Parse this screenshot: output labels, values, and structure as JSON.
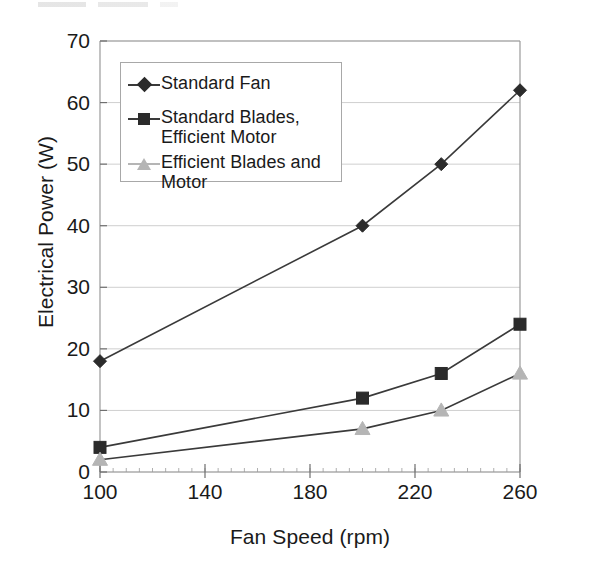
{
  "chart_data": {
    "type": "line",
    "title": "",
    "subtitle": "",
    "xlabel": "Fan Speed (rpm)",
    "ylabel": "Electrical Power (W)",
    "xlim": [
      100,
      260
    ],
    "ylim": [
      0,
      70
    ],
    "xticks": [
      100,
      140,
      180,
      220,
      260
    ],
    "yticks": [
      0,
      10,
      20,
      30,
      40,
      50,
      60,
      70
    ],
    "xtick_labels": [
      "100",
      "140",
      "180",
      "220",
      "260"
    ],
    "ytick_labels": [
      "0",
      "10",
      "20",
      "30",
      "40",
      "50",
      "60",
      "70"
    ],
    "grid": "horizontal",
    "legend_position": "upper-left-inside",
    "x": [
      100,
      200,
      230,
      260
    ],
    "series": [
      {
        "name": "Standard Fan",
        "marker": "diamond",
        "color": "#2b2b2b",
        "line_color": "#3a3a3a",
        "values": [
          18,
          40,
          50,
          62
        ]
      },
      {
        "name": "Standard Blades,\nEfficient Motor",
        "marker": "square",
        "color": "#2b2b2b",
        "line_color": "#3a3a3a",
        "values": [
          4,
          12,
          16,
          24
        ]
      },
      {
        "name": "Efficient Blades and\nMotor",
        "marker": "triangle",
        "color": "#b5b5b5",
        "line_color": "#3a3a3a",
        "values": [
          2,
          7,
          10,
          16
        ]
      }
    ]
  },
  "axes": {
    "y_title": "Electrical Power (W)",
    "x_title": "Fan Speed (rpm)",
    "y_labels": [
      "70",
      "60",
      "50",
      "40",
      "30",
      "20",
      "10",
      "0"
    ],
    "x_labels": [
      "100",
      "140",
      "180",
      "220",
      "260"
    ]
  },
  "legend": {
    "items": [
      {
        "label": "Standard Fan",
        "marker": "diamond-marker-icon",
        "color": "#2b2b2b"
      },
      {
        "label": "Standard Blades,\nEfficient Motor",
        "marker": "square-marker-icon",
        "color": "#2b2b2b"
      },
      {
        "label": "Efficient Blades and\nMotor",
        "marker": "triangle-marker-icon",
        "color": "#b5b5b5"
      }
    ]
  },
  "style": {
    "plot_border_color": "#9a9a9a",
    "grid_color": "#cfcfcf",
    "background": "#ffffff",
    "text_color": "#1a1a1a"
  }
}
